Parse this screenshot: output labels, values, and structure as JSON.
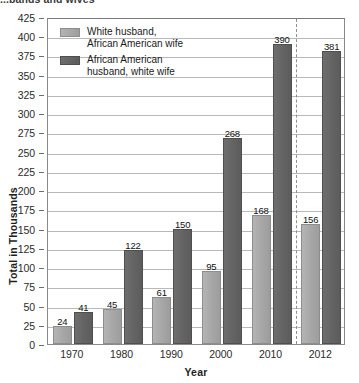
{
  "chart_data": {
    "type": "bar",
    "title": "...bands and wives",
    "xlabel": "Year",
    "ylabel": "Total in Thousands",
    "categories": [
      "1970",
      "1980",
      "1990",
      "2000",
      "2010",
      "2012"
    ],
    "series": [
      {
        "name": "White husband, African American wife",
        "color": "#a6a6a6",
        "values": [
          24,
          45,
          61,
          95,
          168,
          156
        ]
      },
      {
        "name": "African American husband, white wife",
        "color": "#636363",
        "values": [
          41,
          122,
          150,
          268,
          390,
          381
        ]
      }
    ],
    "ylim": [
      0,
      425
    ],
    "ytick_step": 25,
    "yticks": [
      0,
      25,
      50,
      75,
      100,
      125,
      150,
      175,
      200,
      225,
      250,
      275,
      300,
      325,
      350,
      375,
      400,
      425
    ],
    "grid": true,
    "legend_position": "inside-top-left",
    "annotations": {
      "divider_after_category": "2010",
      "divider_style": "dashed-vertical"
    }
  },
  "legend": {
    "items": [
      {
        "line1": "White husband,",
        "line2": "African American wife",
        "swatch": "light"
      },
      {
        "line1": "African American",
        "line2": "husband, white wife",
        "swatch": "dark"
      }
    ]
  }
}
